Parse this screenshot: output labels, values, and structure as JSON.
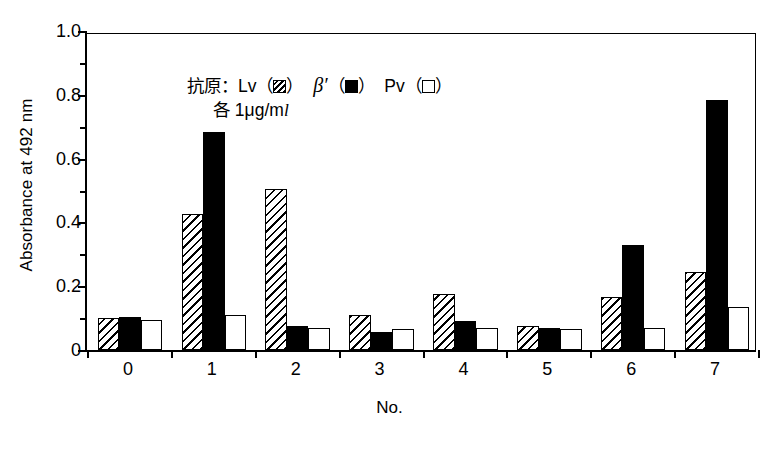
{
  "axes": {
    "ylabel": "Absorbance at 492 nm",
    "xlabel": "No.",
    "yticks": [
      "0",
      "0.2",
      "0.4",
      "0.6",
      "0.8",
      "1.0"
    ],
    "ytick_values": [
      0,
      0.2,
      0.4,
      0.6,
      0.8,
      1.0
    ],
    "yminor_values": [
      0.1,
      0.3,
      0.5,
      0.7,
      0.9
    ],
    "ylim": [
      0,
      1.0
    ]
  },
  "legend": {
    "line1_prefix": "抗原：Lv",
    "line1_paren_open": "（",
    "line1_paren_close": "）",
    "beta": "β′",
    "pv": "Pv",
    "line2_prefix": "各 1",
    "line2_mu": "μ",
    "line2_g": "g/m",
    "line2_l": "l",
    "swatch_lv": "hatched-square-icon",
    "swatch_beta": "filled-square-icon",
    "swatch_pv": "open-square-icon"
  },
  "chart_data": {
    "type": "bar",
    "title": "",
    "xlabel": "No.",
    "ylabel": "Absorbance at 492 nm",
    "ylim": [
      0,
      1.0
    ],
    "grid": false,
    "legend_position": "inside-top-left",
    "categories": [
      "0",
      "1",
      "2",
      "3",
      "4",
      "5",
      "6",
      "7"
    ],
    "series": [
      {
        "name": "Lv",
        "fill": "hatched",
        "values": [
          0.1,
          0.425,
          0.505,
          0.11,
          0.175,
          0.075,
          0.165,
          0.245
        ]
      },
      {
        "name": "β′",
        "fill": "solid-black",
        "values": [
          0.105,
          0.685,
          0.075,
          0.055,
          0.09,
          0.07,
          0.33,
          0.785
        ]
      },
      {
        "name": "Pv",
        "fill": "open-white",
        "values": [
          0.095,
          0.11,
          0.07,
          0.065,
          0.07,
          0.065,
          0.07,
          0.135
        ]
      }
    ],
    "annotations": [
      "抗原：Lv（☒） β′（■） Pv（□）",
      "各 1μg/ml"
    ]
  }
}
